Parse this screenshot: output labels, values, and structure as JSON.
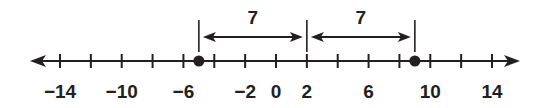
{
  "number_line": {
    "min_tick": -14,
    "max_tick": 14,
    "tick_step": 2,
    "tick_labels": [
      "−14",
      "−10",
      "−6",
      "−2",
      "0",
      "2",
      "6",
      "10",
      "14"
    ],
    "tick_label_values": [
      -14,
      -10,
      -6,
      -2,
      0,
      2,
      6,
      10,
      14
    ],
    "points": [
      -5,
      9
    ],
    "midpoint": 2,
    "distances": [
      {
        "from": -5,
        "to": 2,
        "label": "7"
      },
      {
        "from": 2,
        "to": 9,
        "label": "7"
      }
    ]
  },
  "colors": {
    "line": "#231f20",
    "background": "#ffffff"
  }
}
